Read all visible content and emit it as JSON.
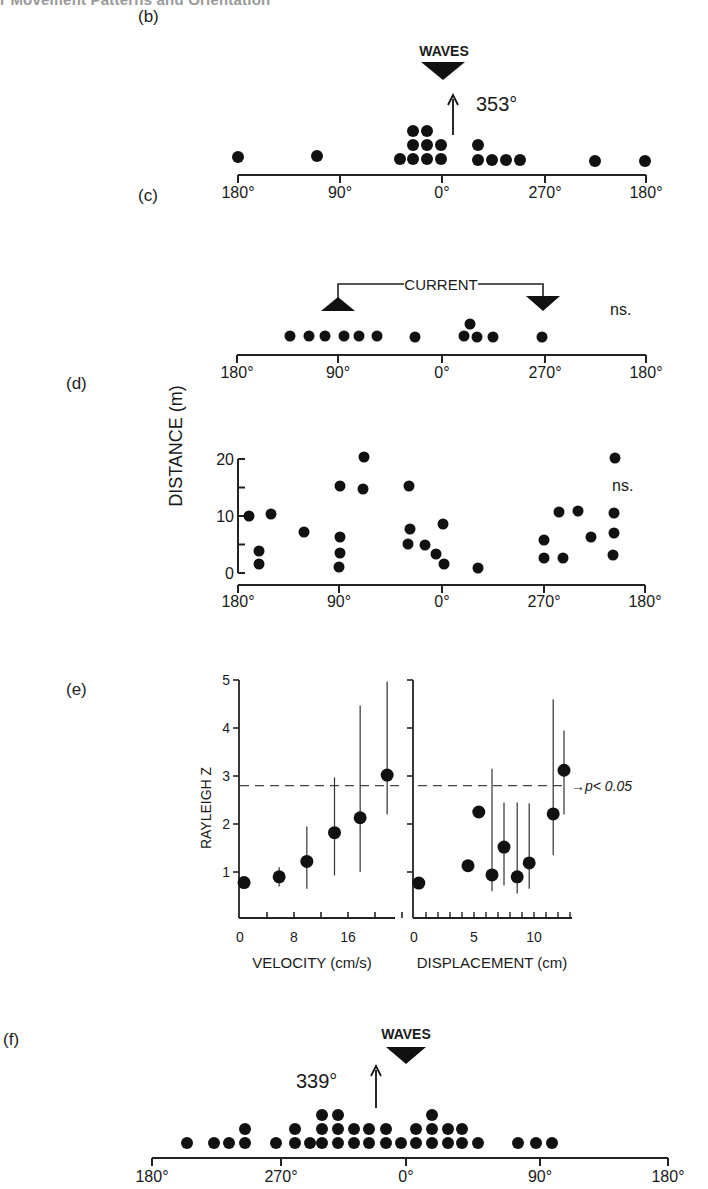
{
  "header": {
    "title": "r Movement Patterns and Orientation"
  },
  "panel_labels": {
    "b": "(b)",
    "c": "(c)",
    "d": "(d)",
    "e": "(e)",
    "f": "(f)"
  },
  "chart_data": [
    {
      "id": "b",
      "type": "scatter",
      "subtype": "circular-dot-histogram",
      "title": "",
      "annotation": "WAVES",
      "mean_direction_label": "353°",
      "mean_direction": 353,
      "stimulus_marker": {
        "label": "WAVES",
        "direction": 0,
        "shape": "down-triangle"
      },
      "xlabel": "",
      "x_tick_labels": [
        "180°",
        "90°",
        "0°",
        "270°",
        "180°"
      ],
      "axis_pixels": {
        "x0": 238,
        "x1": 646,
        "y": 175,
        "ticks": [
          238,
          340,
          442,
          545,
          646
        ]
      },
      "dots_px": [
        [
          238,
          157
        ],
        [
          317,
          156
        ],
        [
          400,
          159
        ],
        [
          413,
          159
        ],
        [
          427,
          159
        ],
        [
          441,
          159
        ],
        [
          413,
          145
        ],
        [
          427,
          145
        ],
        [
          441,
          145
        ],
        [
          413,
          131
        ],
        [
          427,
          131
        ],
        [
          478,
          145
        ],
        [
          478,
          160
        ],
        [
          492,
          160
        ],
        [
          506,
          160
        ],
        [
          520,
          160
        ],
        [
          595,
          161
        ],
        [
          645,
          161
        ]
      ],
      "n": 18
    },
    {
      "id": "c",
      "type": "scatter",
      "subtype": "circular-dot-histogram",
      "annotation": "CURRENT",
      "significance": "ns.",
      "stimulus_markers": [
        {
          "label": "CURRENT",
          "direction": 90,
          "shape": "up-triangle"
        },
        {
          "label": "CURRENT",
          "direction": 270,
          "shape": "down-triangle"
        }
      ],
      "x_tick_labels": [
        "180°",
        "90°",
        "0°",
        "270°",
        "180°"
      ],
      "axis_pixels": {
        "x0": 237,
        "x1": 646,
        "y": 355,
        "ticks": [
          237,
          338,
          442,
          545,
          646
        ]
      },
      "dots_px": [
        [
          290,
          336
        ],
        [
          309,
          336
        ],
        [
          325,
          336
        ],
        [
          344,
          336
        ],
        [
          359,
          336
        ],
        [
          377,
          336
        ],
        [
          415,
          337
        ],
        [
          464,
          336
        ],
        [
          477,
          337
        ],
        [
          493,
          337
        ],
        [
          470,
          324
        ],
        [
          542,
          337
        ]
      ],
      "n": 12
    },
    {
      "id": "d",
      "type": "scatter",
      "ylabel": "DISTANCE (m)",
      "significance": "ns.",
      "y_ticks": [
        0,
        10,
        20
      ],
      "ylim": [
        0,
        20
      ],
      "x_tick_labels": [
        "180°",
        "90°",
        "0°",
        "270°",
        "180°"
      ],
      "axis_pixels": {
        "x0": 238,
        "x1": 645,
        "xaxis_y": 585,
        "yaxis_x": 238,
        "y0px": 573,
        "y20px": 459,
        "ticks": [
          238,
          339,
          442,
          544,
          645
        ]
      },
      "points": [
        {
          "angle": 169,
          "distance": 10.0
        },
        {
          "angle": 161,
          "distance": 3.9
        },
        {
          "angle": 160,
          "distance": 1.6
        },
        {
          "angle": 150,
          "distance": 10.4
        },
        {
          "angle": 121,
          "distance": 7.3
        },
        {
          "angle": 90,
          "distance": 15.3
        },
        {
          "angle": 90,
          "distance": 6.3
        },
        {
          "angle": 90,
          "distance": 3.5
        },
        {
          "angle": 90,
          "distance": 1.1
        },
        {
          "angle": 69,
          "distance": 20.4
        },
        {
          "angle": 70,
          "distance": 14.7
        },
        {
          "angle": 29,
          "distance": 15.3
        },
        {
          "angle": 28,
          "distance": 7.7
        },
        {
          "angle": 30,
          "distance": 5.1
        },
        {
          "angle": 15,
          "distance": 4.9
        },
        {
          "angle": 5,
          "distance": 3.3
        },
        {
          "angle": 358,
          "distance": 1.6
        },
        {
          "angle": 359,
          "distance": 8.6
        },
        {
          "angle": 328,
          "distance": 0.9
        },
        {
          "angle": 270,
          "distance": 5.8
        },
        {
          "angle": 270,
          "distance": 2.7
        },
        {
          "angle": 283,
          "distance": 10.7
        },
        {
          "angle": 285,
          "distance": 2.6
        },
        {
          "angle": 300,
          "distance": 10.9
        },
        {
          "angle": 312,
          "distance": 6.4
        },
        {
          "angle": 333,
          "distance": 20.2
        },
        {
          "angle": 332,
          "distance": 10.6
        },
        {
          "angle": 332,
          "distance": 7.1
        },
        {
          "angle": 331,
          "distance": 3.1
        }
      ],
      "points_px": [
        [
          249,
          516
        ],
        [
          259,
          551
        ],
        [
          259,
          564
        ],
        [
          271,
          514
        ],
        [
          304,
          532
        ],
        [
          340,
          486
        ],
        [
          340,
          537
        ],
        [
          340,
          553
        ],
        [
          339,
          567
        ],
        [
          364,
          457
        ],
        [
          363,
          489
        ],
        [
          409,
          486
        ],
        [
          410,
          529
        ],
        [
          408,
          544
        ],
        [
          425,
          545
        ],
        [
          436,
          554
        ],
        [
          444,
          564
        ],
        [
          443,
          524
        ],
        [
          478,
          568
        ],
        [
          544,
          540
        ],
        [
          544,
          558
        ],
        [
          559,
          512
        ],
        [
          563,
          558
        ],
        [
          578,
          511
        ],
        [
          591,
          537
        ],
        [
          615,
          458
        ],
        [
          614,
          513
        ],
        [
          614,
          533
        ],
        [
          613,
          555
        ]
      ]
    },
    {
      "id": "e-velocity",
      "type": "scatter",
      "subtype": "errorbar",
      "xlabel": "VELOCITY (cm/s)",
      "ylabel": "RAYLEIGH Z",
      "x_ticks": [
        0,
        8,
        16
      ],
      "y_ticks": [
        1,
        2,
        3,
        4,
        5
      ],
      "xlim": [
        0,
        24
      ],
      "ylim": [
        0,
        5
      ],
      "reference_line": {
        "y": 2.8,
        "style": "dashed"
      },
      "points": [
        {
          "x": 0.6,
          "y": 0.78
        },
        {
          "x": 5.8,
          "y": 0.9,
          "err_low": 0.7,
          "err_high": 1.1
        },
        {
          "x": 9.9,
          "y": 1.22,
          "err_low": 0.65,
          "err_high": 1.95
        },
        {
          "x": 14.0,
          "y": 1.82,
          "err_low": 0.93,
          "err_high": 2.97
        },
        {
          "x": 17.8,
          "y": 2.13,
          "err_low": 1.0,
          "err_high": 4.47
        },
        {
          "x": 21.8,
          "y": 3.02,
          "err_low": 2.2,
          "err_high": 4.97
        }
      ]
    },
    {
      "id": "e-displacement",
      "type": "scatter",
      "subtype": "errorbar",
      "xlabel": "DISPLACEMENT (cm)",
      "ylabel": "RAYLEIGH Z",
      "x_ticks": [
        0,
        5,
        10
      ],
      "xlim": [
        0,
        13
      ],
      "ylim": [
        0,
        5
      ],
      "reference_line": {
        "y": 2.8,
        "style": "dashed",
        "label": "→p< 0.05"
      },
      "points": [
        {
          "x": 0.4,
          "y": 0.77
        },
        {
          "x": 4.5,
          "y": 1.13
        },
        {
          "x": 5.4,
          "y": 2.25
        },
        {
          "x": 6.5,
          "y": 0.94,
          "err_low": 0.6,
          "err_high": 3.15
        },
        {
          "x": 7.5,
          "y": 1.52,
          "err_low": 0.72,
          "err_high": 2.45
        },
        {
          "x": 8.6,
          "y": 0.9,
          "err_low": 0.55,
          "err_high": 2.45
        },
        {
          "x": 9.6,
          "y": 1.19,
          "err_low": 0.65,
          "err_high": 2.43
        },
        {
          "x": 11.6,
          "y": 2.21,
          "err_low": 1.35,
          "err_high": 4.6
        },
        {
          "x": 12.5,
          "y": 3.12,
          "err_low": 2.2,
          "err_high": 3.95
        }
      ]
    },
    {
      "id": "f",
      "type": "scatter",
      "subtype": "circular-dot-histogram",
      "annotation": "WAVES",
      "mean_direction_label": "339°",
      "mean_direction": 339,
      "stimulus_marker": {
        "label": "WAVES",
        "direction": 0,
        "shape": "down-triangle"
      },
      "x_tick_labels": [
        "180°",
        "270°",
        "0°",
        "90°",
        "180°"
      ],
      "axis_pixels": {
        "x0": 152,
        "x1": 668,
        "y": 1158,
        "ticks": [
          152,
          281,
          406,
          540,
          668
        ]
      },
      "columns_px": [
        {
          "x": 187,
          "count": 1
        },
        {
          "x": 214,
          "count": 1
        },
        {
          "x": 229,
          "count": 1
        },
        {
          "x": 245,
          "count": 2
        },
        {
          "x": 276,
          "count": 1
        },
        {
          "x": 295,
          "count": 2
        },
        {
          "x": 310,
          "count": 1
        },
        {
          "x": 322,
          "count": 3
        },
        {
          "x": 338,
          "count": 3
        },
        {
          "x": 354,
          "count": 2
        },
        {
          "x": 369,
          "count": 2
        },
        {
          "x": 386,
          "count": 2
        },
        {
          "x": 401,
          "count": 1
        },
        {
          "x": 416,
          "count": 2
        },
        {
          "x": 432,
          "count": 3
        },
        {
          "x": 448,
          "count": 2
        },
        {
          "x": 462,
          "count": 2
        },
        {
          "x": 478,
          "count": 1
        },
        {
          "x": 518,
          "count": 1
        },
        {
          "x": 536,
          "count": 1
        },
        {
          "x": 552,
          "count": 1
        }
      ],
      "n": 35
    }
  ]
}
